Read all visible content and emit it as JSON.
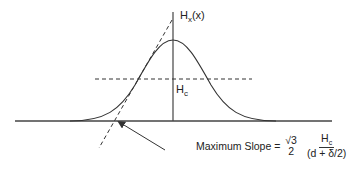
{
  "diagram": {
    "colors": {
      "line": "#333333",
      "background": "#ffffff"
    },
    "labels": {
      "y_axis": {
        "main": "H",
        "sub": "x",
        "suffix": "(x)"
      },
      "threshold": {
        "main": "H",
        "sub": "c"
      }
    },
    "formula": {
      "prefix": "Maximum Slope =",
      "frac1_num": "√3",
      "frac1_den": "2",
      "frac2_num_main": "H",
      "frac2_num_sub": "c",
      "frac2_den": "(d + δ/2)"
    },
    "elements": [
      "baseline",
      "vertical-axis",
      "bell-curve",
      "threshold-dashed-line",
      "tangent-dashed-line",
      "pointer-arrow"
    ]
  }
}
